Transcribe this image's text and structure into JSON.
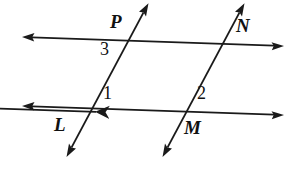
{
  "figure": {
    "background_color": "#ffffff",
    "stroke_color": "#1a1a1a",
    "stroke_width": 1.6
  },
  "point_labels": [
    {
      "id": "P",
      "text": "P"
    },
    {
      "id": "N",
      "text": "N"
    },
    {
      "id": "L",
      "text": "L"
    },
    {
      "id": "M",
      "text": "M"
    }
  ],
  "angle_labels": [
    {
      "id": "angle-3",
      "text": "3"
    },
    {
      "id": "angle-1",
      "text": "1"
    },
    {
      "id": "angle-2",
      "text": "2"
    }
  ],
  "lines": [
    {
      "name": "top-horizontal-line",
      "x1": 24,
      "y1": 37,
      "x2": 282,
      "y2": 46,
      "arrow_start": true,
      "arrow_end": true
    },
    {
      "name": "bottom-horizontal-line",
      "x1": 24,
      "y1": 106,
      "x2": 282,
      "y2": 115,
      "arrow_start": true,
      "arrow_end": true
    },
    {
      "name": "left-transversal-line",
      "x1": 148,
      "y1": 4,
      "x2": 67,
      "y2": 156,
      "arrow_start": true,
      "arrow_end": true
    },
    {
      "name": "right-transversal-line",
      "x1": 244,
      "y1": 4,
      "x2": 163,
      "y2": 156,
      "arrow_start": true,
      "arrow_end": true
    }
  ]
}
